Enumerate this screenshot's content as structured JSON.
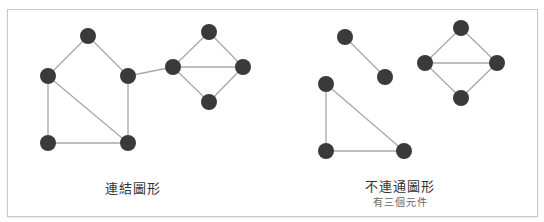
{
  "colors": {
    "node": "#3a3a3a",
    "edge": "#a8a8a8",
    "border": "#c8c8c8"
  },
  "node_radius": 8,
  "graphs": [
    {
      "id": "connected",
      "caption": "連結圖形",
      "nodes": [
        {
          "id": "a",
          "x": 88,
          "y": 36
        },
        {
          "id": "b",
          "x": 48,
          "y": 76
        },
        {
          "id": "c",
          "x": 128,
          "y": 76
        },
        {
          "id": "d",
          "x": 48,
          "y": 143
        },
        {
          "id": "e",
          "x": 128,
          "y": 143
        },
        {
          "id": "f",
          "x": 173,
          "y": 67
        },
        {
          "id": "g",
          "x": 209,
          "y": 32
        },
        {
          "id": "h",
          "x": 243,
          "y": 67
        },
        {
          "id": "i",
          "x": 209,
          "y": 102
        }
      ],
      "edges": [
        [
          "a",
          "b"
        ],
        [
          "a",
          "c"
        ],
        [
          "b",
          "d"
        ],
        [
          "b",
          "e"
        ],
        [
          "c",
          "e"
        ],
        [
          "d",
          "e"
        ],
        [
          "c",
          "f"
        ],
        [
          "f",
          "g"
        ],
        [
          "g",
          "h"
        ],
        [
          "f",
          "h"
        ],
        [
          "f",
          "i"
        ],
        [
          "i",
          "h"
        ]
      ]
    },
    {
      "id": "disconnected",
      "caption": "不連通圖形",
      "subcaption": "有三個元件",
      "nodes": [
        {
          "id": "p",
          "x": 345,
          "y": 37
        },
        {
          "id": "q",
          "x": 385,
          "y": 77
        },
        {
          "id": "r",
          "x": 326,
          "y": 84
        },
        {
          "id": "s",
          "x": 326,
          "y": 151
        },
        {
          "id": "t",
          "x": 404,
          "y": 151
        },
        {
          "id": "u",
          "x": 461,
          "y": 28
        },
        {
          "id": "v",
          "x": 425,
          "y": 63
        },
        {
          "id": "w",
          "x": 497,
          "y": 63
        },
        {
          "id": "z",
          "x": 461,
          "y": 98
        }
      ],
      "edges": [
        [
          "p",
          "q"
        ],
        [
          "r",
          "s"
        ],
        [
          "r",
          "t"
        ],
        [
          "s",
          "t"
        ],
        [
          "u",
          "v"
        ],
        [
          "u",
          "w"
        ],
        [
          "v",
          "w"
        ],
        [
          "v",
          "z"
        ],
        [
          "z",
          "w"
        ]
      ]
    }
  ]
}
